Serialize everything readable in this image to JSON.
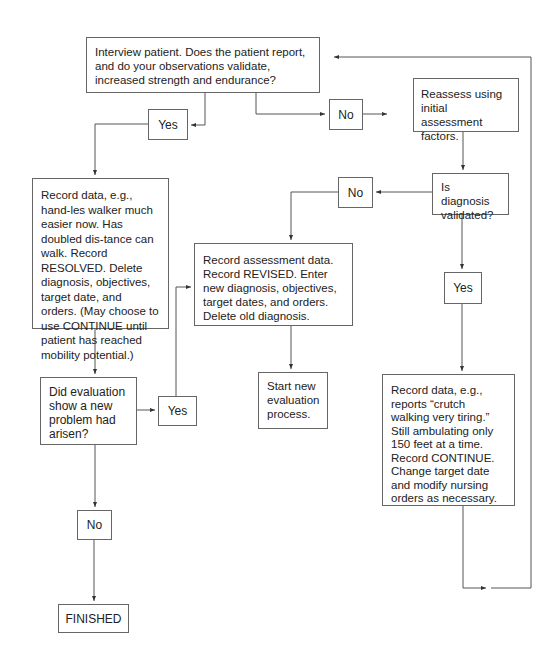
{
  "flowchart": {
    "nodes": {
      "interview": "Interview patient. Does the patient report, and do your observations validate, increased strength and endurance?",
      "yes_1": "Yes",
      "no_1": "No",
      "reassess": "Reassess using initial assessment factors.",
      "is_validated": "Is diagnosis validated?",
      "no_2": "No",
      "yes_2": "Yes",
      "resolved": "Record data, e.g., hand-les walker much easier now. Has doubled dis-tance can walk. Record RESOLVED. Delete diagnosis, objectives, target date, and orders. (May choose to use CONTINUE until patient has reached mobility potential.)",
      "revised": "Record assessment data. Record REVISED. Enter new diagnosis, objectives, target dates, and orders. Delete old diagnosis.",
      "new_problem": "Did evaluation show a new problem had arisen?",
      "yes_3": "Yes",
      "start_new": "Start new evaluation process.",
      "continue": "Record data, e.g., reports “crutch walking very tiring.” Still ambulating only 150 feet at a time. Record CONTINUE. Change target date and modify nursing orders as necessary.",
      "no_3": "No",
      "finished": "FINISHED"
    },
    "edges": [
      {
        "from": "interview",
        "to": "yes_1"
      },
      {
        "from": "interview",
        "to": "no_1"
      },
      {
        "from": "no_1",
        "to": "reassess"
      },
      {
        "from": "reassess",
        "to": "is_validated"
      },
      {
        "from": "is_validated",
        "to": "no_2"
      },
      {
        "from": "is_validated",
        "to": "yes_2"
      },
      {
        "from": "no_2",
        "to": "revised"
      },
      {
        "from": "yes_2",
        "to": "continue"
      },
      {
        "from": "continue",
        "to": "interview"
      },
      {
        "from": "yes_1",
        "to": "resolved"
      },
      {
        "from": "resolved",
        "to": "new_problem"
      },
      {
        "from": "new_problem",
        "to": "yes_3"
      },
      {
        "from": "yes_3",
        "to": "revised"
      },
      {
        "from": "revised",
        "to": "start_new"
      },
      {
        "from": "new_problem",
        "to": "no_3"
      },
      {
        "from": "no_3",
        "to": "finished"
      }
    ],
    "colors": {
      "line": "#555555",
      "border": "#666666",
      "text": "#222222"
    }
  }
}
